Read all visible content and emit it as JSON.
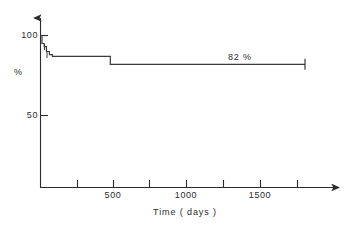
{
  "chart_data": {
    "type": "line",
    "title": "",
    "subtitle": "",
    "xlabel": "Time  ( days )",
    "ylabel": "%",
    "xlim": [
      0,
      2000
    ],
    "ylim": [
      0,
      110
    ],
    "grid": false,
    "legend": null,
    "x_ticks": [
      {
        "value": 250,
        "label": ""
      },
      {
        "value": 500,
        "label": "500"
      },
      {
        "value": 750,
        "label": ""
      },
      {
        "value": 1000,
        "label": "1000"
      },
      {
        "value": 1250,
        "label": ""
      },
      {
        "value": 1500,
        "label": "1500"
      },
      {
        "value": 1750,
        "label": ""
      }
    ],
    "y_ticks": [
      {
        "value": 50,
        "label": "50"
      },
      {
        "value": 100,
        "label": "100"
      }
    ],
    "annotations": [
      {
        "id": "plateau-label",
        "text": "82 %",
        "x": 1340,
        "y": 88
      }
    ],
    "series": [
      {
        "name": "survival",
        "step": "post",
        "points": [
          {
            "x": 0,
            "y": 100
          },
          {
            "x": 10,
            "y": 95
          },
          {
            "x": 25,
            "y": 93
          },
          {
            "x": 40,
            "y": 90
          },
          {
            "x": 60,
            "y": 88
          },
          {
            "x": 80,
            "y": 87
          },
          {
            "x": 470,
            "y": 87
          },
          {
            "x": 470,
            "y": 82
          },
          {
            "x": 1780,
            "y": 82
          }
        ],
        "censor_marks": [
          {
            "x": 1780,
            "y": 82
          }
        ],
        "final_value": 82
      }
    ]
  },
  "axes": {
    "y_tick_100": "100",
    "y_tick_50": "50",
    "y_title": "%",
    "x_tick_500": "500",
    "x_tick_1000": "1000",
    "x_tick_1500": "1500",
    "x_title": "Time  ( days )"
  },
  "annotation": {
    "plateau": "82 %"
  },
  "colors": {
    "ink": "#2b2b2b",
    "curve": "#3a3a3a",
    "background": "#ffffff"
  }
}
